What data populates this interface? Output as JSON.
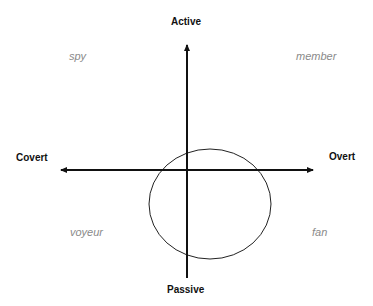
{
  "axes": {
    "top": "Active",
    "bottom": "Passive",
    "left": "Covert",
    "right": "Overt"
  },
  "quadrants": {
    "top_left": "spy",
    "top_right": "member",
    "bottom_left": "voyeur",
    "bottom_right": "fan"
  },
  "colors": {
    "axis": "#111111",
    "quadrant_text": "#8a8a8a"
  }
}
